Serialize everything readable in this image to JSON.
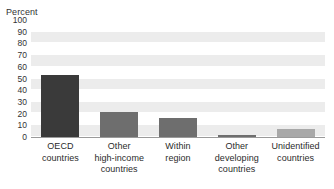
{
  "figure": {
    "clipped_caption": "",
    "unit_label": "Percent"
  },
  "chart_data": {
    "type": "bar",
    "title": "",
    "xlabel": "",
    "ylabel": "Percent",
    "ylim": [
      0,
      100
    ],
    "ytick_step": 10,
    "ytick_labels": [
      "100",
      "90",
      "80",
      "70",
      "60",
      "50",
      "40",
      "30",
      "20",
      "10",
      "0"
    ],
    "grid": "horizontal-bands",
    "legend": "none",
    "categories": [
      "OECD countries",
      "Other high-income countries",
      "Within region",
      "Other developing countries",
      "Unidentified countries"
    ],
    "category_lines": [
      [
        "OECD",
        "countries"
      ],
      [
        "Other",
        "high-income",
        "countries"
      ],
      [
        "Within",
        "region"
      ],
      [
        "Other",
        "developing",
        "countries"
      ],
      [
        "Unidentified",
        "countries"
      ]
    ],
    "values": [
      53,
      21,
      16,
      1,
      7
    ],
    "bar_colors": [
      "#3a3a3a",
      "#6e6e6e",
      "#6e6e6e",
      "#6e6e6e",
      "#a8a8a8"
    ]
  },
  "colors": {
    "plot_background": "#ffffff",
    "band": "#ececec",
    "axis": "#9a9a9a",
    "text": "#2b2b2b"
  }
}
